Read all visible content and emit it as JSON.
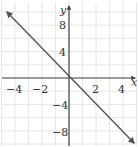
{
  "chart_data": {
    "type": "line",
    "title": "",
    "xlabel": "x",
    "ylabel": "y",
    "xlim": [
      -5,
      5
    ],
    "ylim": [
      -10,
      10
    ],
    "grid": true,
    "x_ticks": [
      -4,
      -2,
      2,
      4
    ],
    "y_ticks": [
      8,
      4,
      -4,
      -8
    ],
    "x_tick_labels": [
      "−4",
      "−2",
      "2",
      "4"
    ],
    "y_tick_labels": [
      "8",
      "4",
      "−4",
      "−8"
    ],
    "series": [
      {
        "name": "y = -2x",
        "equation": "y = -2x",
        "x": [
          -4,
          -2,
          0,
          2,
          4
        ],
        "y": [
          8,
          4,
          0,
          -4,
          -8
        ],
        "arrows": "both-ends"
      }
    ],
    "legend": null
  },
  "colors": {
    "grid": "#e6e6e6",
    "axis": "#444444",
    "line": "#555555",
    "text": "#333333"
  }
}
